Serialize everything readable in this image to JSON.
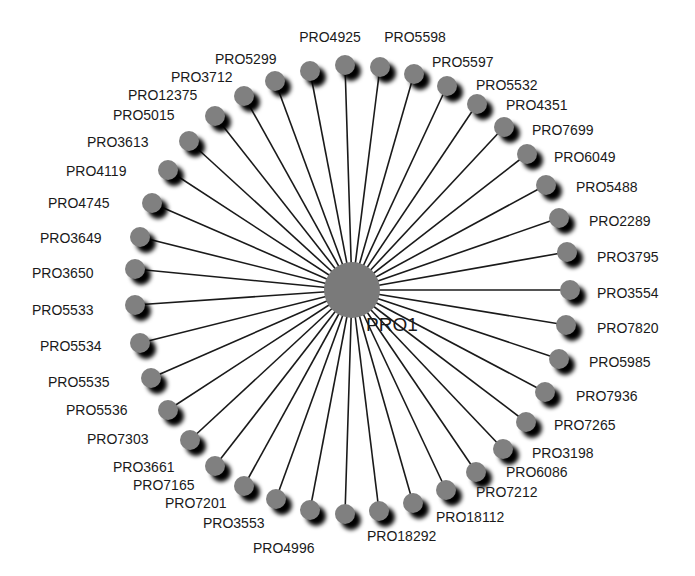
{
  "diagram": {
    "type": "star-network",
    "center": {
      "label": "PRO1",
      "x": 352,
      "y": 290,
      "r": 28,
      "color": "#7a7a7a"
    },
    "edge_color": "#1a1a1a",
    "node_color": "#808080",
    "shadow_color": "#000000",
    "nodes": [
      {
        "label": "PRO4925",
        "x": 345,
        "y": 65,
        "lx": 330,
        "ly": 30,
        "align": "center"
      },
      {
        "label": "PRO5598",
        "x": 380,
        "y": 67,
        "lx": 415,
        "ly": 30,
        "align": "center"
      },
      {
        "label": "PRO5597",
        "x": 414,
        "y": 74,
        "lx": 432,
        "ly": 55,
        "align": "left"
      },
      {
        "label": "PRO5532",
        "x": 447,
        "y": 86,
        "lx": 476,
        "ly": 78,
        "align": "left"
      },
      {
        "label": "PRO4351",
        "x": 477,
        "y": 104,
        "lx": 506,
        "ly": 98,
        "align": "left"
      },
      {
        "label": "PRO7699",
        "x": 504,
        "y": 127,
        "lx": 532,
        "ly": 123,
        "align": "left"
      },
      {
        "label": "PRO6049",
        "x": 527,
        "y": 154,
        "lx": 554,
        "ly": 150,
        "align": "left"
      },
      {
        "label": "PRO5488",
        "x": 546,
        "y": 185,
        "lx": 576,
        "ly": 180,
        "align": "left"
      },
      {
        "label": "PRO2289",
        "x": 559,
        "y": 218,
        "lx": 589,
        "ly": 214,
        "align": "left"
      },
      {
        "label": "PRO3795",
        "x": 567,
        "y": 252,
        "lx": 597,
        "ly": 250,
        "align": "left"
      },
      {
        "label": "PRO3554",
        "x": 570,
        "y": 290,
        "lx": 597,
        "ly": 286,
        "align": "left"
      },
      {
        "label": "PRO7820",
        "x": 566,
        "y": 325,
        "lx": 597,
        "ly": 321,
        "align": "left"
      },
      {
        "label": "PRO5985",
        "x": 559,
        "y": 359,
        "lx": 589,
        "ly": 355,
        "align": "left"
      },
      {
        "label": "PRO7936",
        "x": 545,
        "y": 392,
        "lx": 576,
        "ly": 389,
        "align": "left"
      },
      {
        "label": "PRO7265",
        "x": 526,
        "y": 422,
        "lx": 554,
        "ly": 418,
        "align": "left"
      },
      {
        "label": "PRO3198",
        "x": 503,
        "y": 449,
        "lx": 532,
        "ly": 446,
        "align": "left"
      },
      {
        "label": "PRO6086",
        "x": 476,
        "y": 472,
        "lx": 506,
        "ly": 465,
        "align": "left"
      },
      {
        "label": "PRO7212",
        "x": 446,
        "y": 490,
        "lx": 476,
        "ly": 485,
        "align": "left"
      },
      {
        "label": "PRO18112",
        "x": 413,
        "y": 503,
        "lx": 436,
        "ly": 510,
        "align": "left"
      },
      {
        "label": "PRO18292",
        "x": 379,
        "y": 511,
        "lx": 367,
        "ly": 529,
        "align": "left"
      },
      {
        "label": "PRO4996",
        "x": 345,
        "y": 514,
        "lx": 253,
        "ly": 541,
        "align": "left"
      },
      {
        "label": "PRO3553",
        "x": 310,
        "y": 510,
        "lx": 203,
        "ly": 516,
        "align": "left"
      },
      {
        "label": "PRO7201",
        "x": 276,
        "y": 499,
        "lx": 165,
        "ly": 496,
        "align": "left"
      },
      {
        "label": "PRO7165",
        "x": 244,
        "y": 486,
        "lx": 133,
        "ly": 478,
        "align": "left"
      },
      {
        "label": "PRO3661",
        "x": 215,
        "y": 466,
        "lx": 113,
        "ly": 460,
        "align": "left"
      },
      {
        "label": "PRO7303",
        "x": 190,
        "y": 440,
        "lx": 87,
        "ly": 432,
        "align": "left"
      },
      {
        "label": "PRO5536",
        "x": 168,
        "y": 410,
        "lx": 66,
        "ly": 403,
        "align": "left"
      },
      {
        "label": "PRO5535",
        "x": 151,
        "y": 378,
        "lx": 48,
        "ly": 375,
        "align": "left"
      },
      {
        "label": "PRO5534",
        "x": 140,
        "y": 343,
        "lx": 40,
        "ly": 339,
        "align": "left"
      },
      {
        "label": "PRO5533",
        "x": 135,
        "y": 305,
        "lx": 32,
        "ly": 303,
        "align": "left"
      },
      {
        "label": "PRO3650",
        "x": 135,
        "y": 269,
        "lx": 32,
        "ly": 266,
        "align": "left"
      },
      {
        "label": "PRO3649",
        "x": 140,
        "y": 237,
        "lx": 40,
        "ly": 231,
        "align": "left"
      },
      {
        "label": "PRO4745",
        "x": 152,
        "y": 203,
        "lx": 48,
        "ly": 196,
        "align": "left"
      },
      {
        "label": "PRO4119",
        "x": 168,
        "y": 170,
        "lx": 66,
        "ly": 164,
        "align": "left"
      },
      {
        "label": "PRO3613",
        "x": 189,
        "y": 141,
        "lx": 87,
        "ly": 135,
        "align": "left"
      },
      {
        "label": "PRO5015",
        "x": 215,
        "y": 116,
        "lx": 113,
        "ly": 108,
        "align": "left"
      },
      {
        "label": "PRO12375",
        "x": 244,
        "y": 96,
        "lx": 128,
        "ly": 88,
        "align": "left"
      },
      {
        "label": "PRO3712",
        "x": 275,
        "y": 81,
        "lx": 171,
        "ly": 70,
        "align": "left"
      },
      {
        "label": "PRO5299",
        "x": 310,
        "y": 71,
        "lx": 215,
        "ly": 52,
        "align": "left"
      }
    ]
  }
}
